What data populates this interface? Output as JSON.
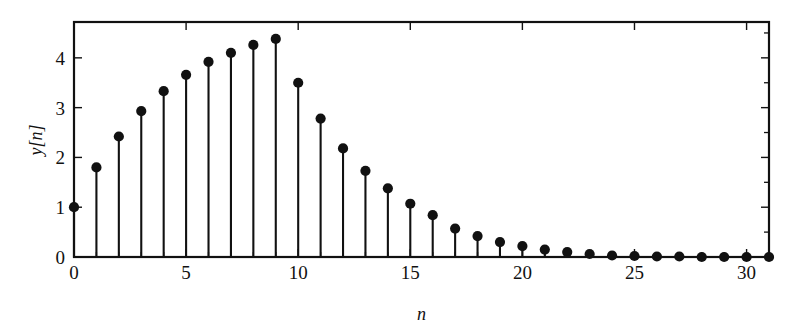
{
  "chart_data": {
    "type": "scatter",
    "plot_style": "stem",
    "title": "",
    "subtitle": "",
    "xlabel": "n",
    "ylabel": "y[n]",
    "xlim": [
      0,
      31
    ],
    "ylim": [
      0,
      4.72
    ],
    "grid": false,
    "legend": null,
    "x_ticks_major": [
      0,
      5,
      10,
      15,
      20,
      25,
      30
    ],
    "x_tick_labels": [
      "0",
      "5",
      "10",
      "15",
      "20",
      "25",
      "30"
    ],
    "x_ticks_minor": [
      1,
      2,
      3,
      4,
      6,
      7,
      8,
      9,
      11,
      12,
      13,
      14,
      16,
      17,
      18,
      19,
      21,
      22,
      23,
      24,
      26,
      27,
      28,
      29,
      31
    ],
    "y_ticks_major": [
      0,
      1,
      2,
      3,
      4
    ],
    "y_tick_labels": [
      "0",
      "1",
      "2",
      "3",
      "4"
    ],
    "y_ticks_minor": [
      0.5,
      1.5,
      2.5,
      3.5,
      4.5
    ],
    "x": [
      0,
      1,
      2,
      3,
      4,
      5,
      6,
      7,
      8,
      9,
      10,
      11,
      12,
      13,
      14,
      15,
      16,
      17,
      18,
      19,
      20,
      21,
      22,
      23,
      24,
      25,
      26,
      27,
      28,
      29,
      30,
      31
    ],
    "values": [
      1.0,
      1.8,
      2.42,
      2.93,
      3.33,
      3.66,
      3.92,
      4.1,
      4.26,
      4.38,
      3.5,
      2.78,
      2.18,
      1.73,
      1.38,
      1.07,
      0.84,
      0.57,
      0.42,
      0.3,
      0.22,
      0.15,
      0.1,
      0.06,
      0.03,
      0.02,
      0.01,
      0.01,
      0.0,
      0.0,
      0.0,
      0.0
    ],
    "marker": "filled-circle",
    "marker_color": "#111111",
    "line_color": "#111111",
    "background_color": "#ffffff"
  },
  "axes": {
    "frame": "box",
    "tick_direction": "in"
  }
}
